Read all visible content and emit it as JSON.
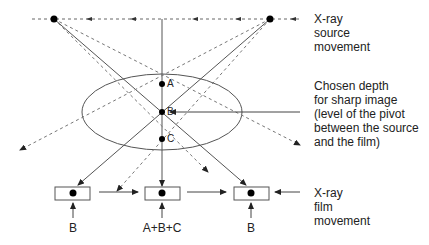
{
  "diagram": {
    "type": "tomography-principle",
    "colors": {
      "line": "#555555",
      "dot": "#000000",
      "text": "#222222"
    },
    "points": [
      {
        "label": "A",
        "desc": "point above focal plane"
      },
      {
        "label": "B",
        "desc": "point at focal plane (pivot)"
      },
      {
        "label": "C",
        "desc": "point below focal plane"
      }
    ],
    "labels": {
      "source_line1": "X-ray",
      "source_line2": "source",
      "source_line3": "movement",
      "depth_line1": "Chosen depth",
      "depth_line2": "for sharp image",
      "depth_line3": "(level of the pivot",
      "depth_line4": "between the source",
      "depth_line5": "and the film)",
      "film_line1": "X-ray",
      "film_line2": "film",
      "film_line3": "movement"
    },
    "film_captions": [
      "B",
      "A+B+C",
      "B"
    ]
  }
}
